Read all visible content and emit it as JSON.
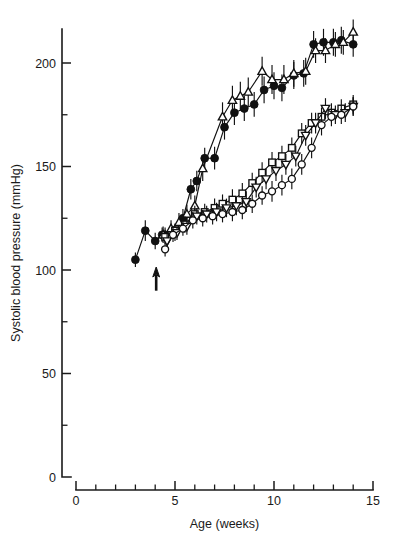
{
  "figure": {
    "title": "",
    "background_color": "#ffffff",
    "ink_color": "#111111"
  },
  "axes": {
    "x": {
      "label": "Age (weeks)",
      "min": 0,
      "max": 15,
      "major_ticks": [
        0,
        5,
        10,
        15
      ],
      "major_tick_labels": [
        "0",
        "5",
        "10",
        "15"
      ],
      "minor_ticks": [
        1,
        2,
        3,
        4,
        6,
        7,
        8,
        9,
        11,
        12,
        13,
        14
      ]
    },
    "y": {
      "label": "Systolic blood pressure (mmHg)",
      "min": 0,
      "max": 215,
      "major_ticks": [
        0,
        50,
        100,
        150,
        200
      ],
      "major_tick_labels": [
        "0",
        "50",
        "100",
        "150",
        "200"
      ],
      "minor_ticks": [
        25,
        75,
        125,
        175
      ]
    }
  },
  "annotations": [
    {
      "name": "treatment-arrow",
      "type": "up-arrow",
      "x": 4.05,
      "y_tip": 100,
      "y_tail": 90,
      "label": ""
    }
  ],
  "chart_data": {
    "type": "line",
    "title": "",
    "xlabel": "Age (weeks)",
    "ylabel": "Systolic blood pressure (mmHg)",
    "xlim": [
      0,
      15
    ],
    "ylim": [
      0,
      215
    ],
    "grid": false,
    "legend": "none",
    "error_bars": "SEM (vertical)",
    "series": [
      {
        "name": "filled-circle-series",
        "marker": "filled-circle",
        "x": [
          3.0,
          3.5,
          4.0,
          4.35,
          4.5,
          5.0,
          5.4,
          5.8,
          6.1,
          6.5,
          7.0,
          7.5,
          8.0,
          8.5,
          9.0,
          9.5,
          10.0,
          10.4,
          11.0,
          11.5,
          12.0,
          12.5,
          13.0,
          13.4,
          14.0
        ],
        "y": [
          105,
          119,
          114,
          117,
          117,
          118,
          125,
          139,
          143,
          154,
          154,
          169,
          176,
          178,
          180,
          187,
          189,
          188,
          194,
          195,
          209,
          210,
          210,
          211,
          209
        ],
        "err": [
          3.5,
          5.0,
          4.0,
          3.5,
          3.5,
          4.0,
          4.5,
          5.0,
          5.0,
          5.0,
          5.5,
          6.0,
          6.0,
          6.0,
          6.0,
          6.5,
          6.5,
          6.5,
          6.5,
          6.5,
          6.5,
          6.5,
          6.5,
          6.5,
          6.0
        ]
      },
      {
        "name": "open-triangle-up-series",
        "marker": "open-triangle-up",
        "x": [
          4.4,
          4.8,
          5.2,
          5.6,
          6.0,
          6.4,
          7.4,
          7.9,
          8.3,
          8.7,
          9.4,
          9.9,
          10.5,
          11.0,
          11.6,
          12.1,
          12.6,
          13.1,
          13.5,
          14.0
        ],
        "y": [
          117,
          120,
          123,
          127,
          131,
          149,
          174,
          182,
          184,
          186,
          196,
          192,
          192,
          195,
          196,
          206,
          206,
          209,
          210,
          215
        ],
        "err": [
          4.0,
          4.0,
          4.5,
          4.5,
          5.0,
          6.0,
          7.0,
          7.0,
          7.0,
          7.0,
          7.0,
          7.0,
          7.0,
          6.5,
          6.5,
          6.0,
          6.0,
          6.0,
          6.0,
          6.0
        ]
      },
      {
        "name": "open-square-series",
        "marker": "open-square",
        "x": [
          4.5,
          5.0,
          5.5,
          6.0,
          6.5,
          7.0,
          7.4,
          7.9,
          8.4,
          8.9,
          9.4,
          9.9,
          10.4,
          10.9,
          11.4,
          11.9,
          12.4,
          12.9,
          13.4,
          14.0
        ],
        "y": [
          116,
          119,
          122,
          127,
          128,
          130,
          132,
          134,
          137,
          142,
          147,
          152,
          155,
          159,
          166,
          171,
          174,
          176,
          178,
          180
        ],
        "err": [
          3.5,
          3.5,
          4.0,
          4.0,
          4.0,
          4.5,
          4.5,
          5.0,
          5.0,
          5.0,
          5.0,
          5.0,
          5.0,
          5.0,
          5.0,
          5.0,
          4.5,
          4.5,
          4.5,
          4.5
        ]
      },
      {
        "name": "open-triangle-down-series",
        "marker": "open-triangle-down",
        "x": [
          4.6,
          5.1,
          5.6,
          6.1,
          6.6,
          7.1,
          7.6,
          8.1,
          8.6,
          9.1,
          9.6,
          10.1,
          10.6,
          11.1,
          11.6,
          12.1,
          12.6,
          13.1,
          13.6,
          14.0
        ],
        "y": [
          114,
          118,
          121,
          126,
          127,
          128,
          130,
          131,
          133,
          140,
          144,
          148,
          151,
          155,
          165,
          171,
          178,
          175,
          176,
          179
        ],
        "err": [
          3.5,
          3.5,
          4.0,
          4.0,
          4.0,
          4.5,
          4.5,
          4.5,
          5.0,
          5.0,
          5.0,
          5.0,
          5.0,
          5.0,
          5.0,
          5.0,
          5.0,
          4.5,
          4.5,
          4.5
        ]
      },
      {
        "name": "open-circle-series",
        "marker": "open-circle",
        "x": [
          4.5,
          4.9,
          5.4,
          5.9,
          6.4,
          6.9,
          7.4,
          7.9,
          8.4,
          8.9,
          9.4,
          9.9,
          10.4,
          10.9,
          11.4,
          11.9,
          12.4,
          12.9,
          13.4,
          14.0
        ],
        "y": [
          110,
          117,
          120,
          124,
          125,
          126,
          127,
          128,
          129,
          132,
          136,
          138,
          141,
          144,
          151,
          159,
          170,
          174,
          175,
          179
        ],
        "err": [
          3.5,
          3.5,
          3.5,
          4.0,
          4.0,
          4.0,
          4.0,
          4.5,
          4.5,
          4.5,
          4.5,
          5.0,
          5.0,
          5.0,
          5.0,
          5.0,
          5.0,
          4.5,
          4.5,
          4.5
        ]
      }
    ]
  }
}
